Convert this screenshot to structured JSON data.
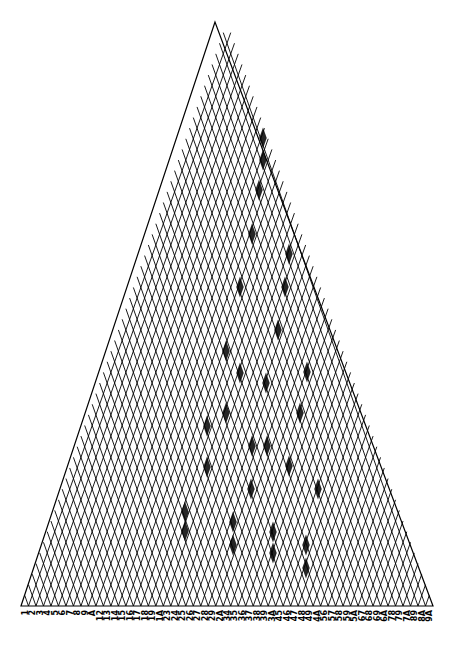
{
  "diagram": {
    "type": "triangular-lattice",
    "stroke_color": "#000000",
    "fill_color": "#000000",
    "apex": [
      215,
      22
    ],
    "base_left": [
      21,
      606
    ],
    "base_right": [
      433,
      606
    ],
    "line_count": 55,
    "base_labels": [
      "1",
      "2",
      "3",
      "4",
      "5",
      "6",
      "7",
      "8",
      "9",
      "A",
      "12",
      "13",
      "14",
      "15",
      "16",
      "17",
      "18",
      "19",
      "1A",
      "23",
      "24",
      "25",
      "26",
      "27",
      "28",
      "29",
      "2A",
      "34",
      "35",
      "36",
      "37",
      "38",
      "39",
      "3A",
      "45",
      "46",
      "47",
      "48",
      "49",
      "4A",
      "56",
      "57",
      "58",
      "59",
      "5A",
      "67",
      "68",
      "69",
      "6A",
      "78",
      "79",
      "7A",
      "89",
      "8A",
      "9A"
    ],
    "filled_cells": [
      [
        263,
        138
      ],
      [
        263,
        160
      ],
      [
        259,
        190
      ],
      [
        252,
        234
      ],
      [
        289,
        254
      ],
      [
        240,
        287
      ],
      [
        285,
        287
      ],
      [
        278,
        330
      ],
      [
        226,
        351
      ],
      [
        240,
        373
      ],
      [
        307,
        372
      ],
      [
        266,
        383
      ],
      [
        226,
        413
      ],
      [
        207,
        426
      ],
      [
        300,
        413
      ],
      [
        252,
        446
      ],
      [
        267,
        446
      ],
      [
        207,
        467
      ],
      [
        289,
        466
      ],
      [
        251,
        489
      ],
      [
        318,
        489
      ],
      [
        185,
        512
      ],
      [
        185,
        531
      ],
      [
        233,
        522
      ],
      [
        233,
        545
      ],
      [
        273,
        532
      ],
      [
        273,
        553
      ],
      [
        306,
        545
      ],
      [
        306,
        568
      ]
    ]
  }
}
